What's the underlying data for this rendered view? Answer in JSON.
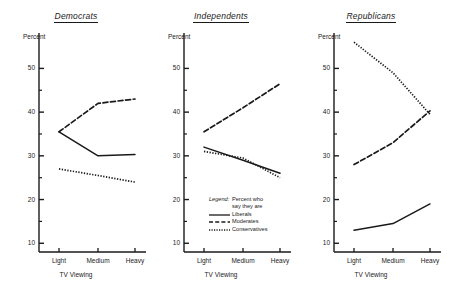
{
  "figure": {
    "y_axis_label": "Percent",
    "x_axis_label": "TV Viewing",
    "x_categories": [
      "Light",
      "Medium",
      "Heavy"
    ],
    "y_major_ticks": [
      10,
      20,
      30,
      40,
      50
    ],
    "y_minor_ticks": [
      15,
      25,
      35,
      45
    ],
    "y_limits": [
      8,
      56.5
    ],
    "line_color": "#1a1a1a"
  },
  "legend": {
    "title_word": "Legend:",
    "title_line1": "Percent who",
    "title_line2": "say they are",
    "entries": [
      {
        "label": "Liberals",
        "style": "solid"
      },
      {
        "label": "Moderates",
        "style": "dashed"
      },
      {
        "label": "Conservatives",
        "style": "dotted"
      }
    ]
  },
  "chart_data": {
    "type": "line",
    "xlabel": "TV Viewing",
    "ylabel": "Percent",
    "x": [
      "Light",
      "Medium",
      "Heavy"
    ],
    "ylim": [
      8,
      56.5
    ],
    "grid": false,
    "legend_position": "inside-center-panel-lower",
    "panels": [
      {
        "title": "Democrats",
        "series": [
          {
            "name": "Liberals",
            "style": "solid",
            "values": [
              35.5,
              30.0,
              30.3
            ]
          },
          {
            "name": "Moderates",
            "style": "dashed",
            "values": [
              35.5,
              42.0,
              43.0
            ]
          },
          {
            "name": "Conservatives",
            "style": "dotted",
            "values": [
              27.0,
              25.5,
              24.0
            ]
          }
        ]
      },
      {
        "title": "Independents",
        "series": [
          {
            "name": "Liberals",
            "style": "solid",
            "values": [
              32.0,
              29.0,
              26.0
            ]
          },
          {
            "name": "Moderates",
            "style": "dashed",
            "values": [
              35.5,
              41.0,
              46.5
            ]
          },
          {
            "name": "Conservatives",
            "style": "dotted",
            "values": [
              31.0,
              29.5,
              25.0
            ]
          }
        ]
      },
      {
        "title": "Republicans",
        "series": [
          {
            "name": "Liberals",
            "style": "solid",
            "values": [
              13.0,
              14.5,
              19.0
            ]
          },
          {
            "name": "Moderates",
            "style": "dashed",
            "values": [
              28.0,
              33.0,
              40.3
            ]
          },
          {
            "name": "Conservatives",
            "style": "dotted",
            "values": [
              56.0,
              49.0,
              39.5
            ]
          }
        ]
      }
    ]
  }
}
